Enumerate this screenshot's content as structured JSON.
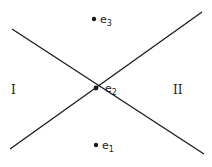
{
  "diagram": {
    "lines": [
      {
        "name": "line-descending",
        "x1": 12,
        "y1": 29,
        "x2": 204,
        "y2": 154
      },
      {
        "name": "line-ascending",
        "x1": 10,
        "y1": 149,
        "x2": 202,
        "y2": 12
      }
    ],
    "points": [
      {
        "name": "e3",
        "label": "e",
        "sub": "3",
        "x": 94,
        "y": 19
      },
      {
        "name": "e2",
        "label": "e",
        "sub": "2",
        "x": 96,
        "y": 88
      },
      {
        "name": "e1",
        "label": "e",
        "sub": "1",
        "x": 96,
        "y": 145
      }
    ],
    "regions": [
      {
        "name": "region-I",
        "label": "I",
        "x": 13,
        "y": 93
      },
      {
        "name": "region-II",
        "label": "II",
        "x": 179,
        "y": 93
      }
    ],
    "colors": {
      "ink": "#1a1a1a",
      "background": "#ffffff"
    }
  }
}
